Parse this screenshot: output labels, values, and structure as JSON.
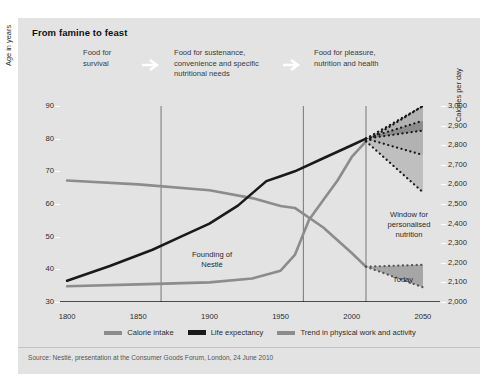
{
  "figure": {
    "title": "From famine to feast",
    "background": "#e3e3e3",
    "source": "Source: Nestlé, presentation at the Consumer Goods Forum, London, 24 June 2010"
  },
  "phases": [
    {
      "label": "Food for\nsurvival"
    },
    {
      "label": "Food for sustenance,\nconvenience and specific\nnutritional needs"
    },
    {
      "label": "Food for pleasure,\nnutrition and health"
    }
  ],
  "arrows": [
    {
      "name": "phase-arrow-1"
    },
    {
      "name": "phase-arrow-2"
    }
  ],
  "annotations": [
    {
      "id": "founding",
      "label": "Founding of\nNestlé",
      "year": 1866
    },
    {
      "id": "window",
      "label": "Window for\npersonalised\nnutrition",
      "year": 2030
    },
    {
      "id": "today",
      "label": "Today",
      "year": 2022
    }
  ],
  "chart_data": {
    "type": "line",
    "title": "From famine to feast",
    "xlabel": "",
    "xlim": [
      1795,
      2062
    ],
    "xticks": [
      1800,
      1850,
      1900,
      1950,
      2000,
      2050
    ],
    "xtick_labels": [
      "1800",
      "1850",
      "1900",
      "1950",
      "2000",
      "2050"
    ],
    "minor_tick_step": 10,
    "grid": false,
    "legend_position": "bottom-center",
    "axes": [
      {
        "id": "left",
        "label": "Age in years",
        "ylim": [
          30,
          90
        ],
        "ticks": [
          30,
          40,
          50,
          60,
          70,
          80,
          90
        ],
        "tick_labels": [
          "30",
          "40",
          "50",
          "60",
          "70",
          "80",
          "90"
        ]
      },
      {
        "id": "right",
        "label": "Calories per day",
        "ylim": [
          2000,
          3000
        ],
        "ticks": [
          2000,
          2100,
          2200,
          2300,
          2400,
          2500,
          2600,
          2700,
          2800,
          2900,
          3000
        ],
        "tick_labels": [
          "2,000",
          "2,100",
          "2,200",
          "2,300",
          "2,400",
          "2,500",
          "2,600",
          "2,700",
          "2,800",
          "2,900",
          "3,000"
        ]
      }
    ],
    "vertical_dividers": [
      1866,
      1966,
      2010
    ],
    "series": [
      {
        "name": "Life expectancy",
        "axis": "left",
        "units": "years",
        "color": "#1a1a1a",
        "width": 2.6,
        "x": [
          1800,
          1830,
          1860,
          1880,
          1900,
          1920,
          1940,
          1950,
          1960,
          1980,
          2000,
          2010
        ],
        "values": [
          36.5,
          41.0,
          46.0,
          50.0,
          54.0,
          59.5,
          67.0,
          68.5,
          70.0,
          74.0,
          78.0,
          80.0
        ],
        "projection": {
          "from_year": 2010,
          "to_year": 2050,
          "from_value": 80.0,
          "upper": 90.0,
          "mid_upper": 85.5,
          "mid_lower": 82.5,
          "lower": 75.0,
          "style": "dotted-cone"
        }
      },
      {
        "name": "Calorie intake",
        "axis": "right",
        "units": "calories per day",
        "color": "#8c8c8c",
        "width": 2.6,
        "x": [
          1800,
          1850,
          1900,
          1930,
          1950,
          1960,
          1970,
          1980,
          1990,
          2000,
          2010
        ],
        "values": [
          2080,
          2090,
          2100,
          2120,
          2160,
          2240,
          2420,
          2520,
          2620,
          2740,
          2820
        ],
        "projection": {
          "from_year": 2010,
          "to_year": 2050,
          "from_value": 2820,
          "upper": 3000,
          "mid_upper": 2890,
          "mid_lower": 2820,
          "lower": 2560,
          "style": "dotted-cone"
        }
      },
      {
        "name": "Trend in physical work and activity",
        "axis": "right",
        "units": "calories per day",
        "color": "#8c8c8c",
        "width": 2.6,
        "x": [
          1800,
          1850,
          1900,
          1930,
          1950,
          1960,
          1980,
          2000,
          2010
        ],
        "values": [
          2620,
          2600,
          2570,
          2530,
          2490,
          2480,
          2380,
          2250,
          2180
        ],
        "projection": {
          "from_year": 2010,
          "to_year": 2050,
          "from_value": 2180,
          "upper": 2190,
          "lower": 2075,
          "style": "dotted-cone"
        }
      }
    ],
    "legend": [
      {
        "label": "Calorie intake",
        "color": "#8c8c8c"
      },
      {
        "label": "Life expectancy",
        "color": "#1a1a1a"
      },
      {
        "label": "Trend in physical work and activity",
        "color": "#8c8c8c"
      }
    ]
  }
}
